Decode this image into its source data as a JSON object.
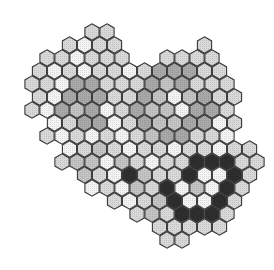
{
  "figure": {
    "geometry": {
      "dx": 15,
      "dy": 13,
      "x0": 2,
      "y0": 32,
      "radius": 8.2
    },
    "shades": {
      "W": "#f4f4f4",
      "L": "#d9d9d9",
      "M": "#a9a9a9",
      "D": "#555555",
      "K": "#2e2e2e",
      "T": "#c4c4c4"
    },
    "stroke": "#3a3a3a",
    "rows": [
      {
        "row": 0,
        "start": 6,
        "cells": "LL"
      },
      {
        "row": 1,
        "start": 4,
        "cells": "LWLL.....L"
      },
      {
        "row": 2,
        "start": 3,
        "cells": "LLWLLL..LLLL"
      },
      {
        "row": 3,
        "start": 2,
        "cells": "LWLWLLWLMMMLL"
      },
      {
        "row": 4,
        "start": 2,
        "cells": "LLWMMLLLMTMLLL"
      },
      {
        "row": 5,
        "start": 2,
        "cells": "LWMMMLLMTWTMLL"
      },
      {
        "row": 6,
        "start": 2,
        "cells": "LWMTMWLMTTWMML"
      },
      {
        "row": 7,
        "start": 3,
        "cells": "WLMMWLMTTMMWL"
      },
      {
        "row": 8,
        "start": 3,
        "cells": "LWLWLWLTMMLLW"
      },
      {
        "row": 9,
        "start": 4,
        "cells": "WLTLWLLWLLWLL"
      },
      {
        "row": 10,
        "start": 4,
        "cells": "LTTWTLWLLKKKLL"
      },
      {
        "row": 11,
        "start": 5,
        "cells": "TLWKTLLKWWKL"
      },
      {
        "row": 12,
        "start": 6,
        "cells": "WLWTLKWTWKL"
      },
      {
        "row": 13,
        "start": 7,
        "cells": "LWLTKWWKL"
      },
      {
        "row": 14,
        "start": 9,
        "cells": "LTLKKKL"
      },
      {
        "row": 15,
        "start": 10,
        "cells": "LLLLL"
      },
      {
        "row": 16,
        "start": 11,
        "cells": "LL"
      }
    ]
  }
}
